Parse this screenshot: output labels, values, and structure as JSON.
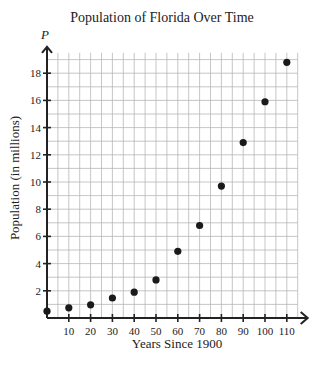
{
  "chart_data": {
    "type": "scatter",
    "title": "Population of Florida Over Time",
    "xlabel": "Years Since 1900",
    "ylabel": "Population (in millions)",
    "y_axis_variable": "P",
    "xlim": [
      0,
      115
    ],
    "ylim": [
      0,
      20
    ],
    "x_ticks": [
      10,
      20,
      30,
      40,
      50,
      60,
      70,
      80,
      90,
      100,
      110
    ],
    "y_ticks": [
      2,
      4,
      6,
      8,
      10,
      12,
      14,
      16,
      18
    ],
    "grid": true,
    "grid_x_step": 5,
    "grid_y_step": 1,
    "legend": null,
    "points": [
      {
        "x": 0,
        "y": 0.5
      },
      {
        "x": 10,
        "y": 0.75
      },
      {
        "x": 20,
        "y": 0.97
      },
      {
        "x": 30,
        "y": 1.47
      },
      {
        "x": 40,
        "y": 1.9
      },
      {
        "x": 50,
        "y": 2.8
      },
      {
        "x": 60,
        "y": 4.9
      },
      {
        "x": 70,
        "y": 6.8
      },
      {
        "x": 80,
        "y": 9.7
      },
      {
        "x": 90,
        "y": 12.9
      },
      {
        "x": 100,
        "y": 15.9
      },
      {
        "x": 110,
        "y": 18.8
      }
    ]
  },
  "colors": {
    "grid": "#b8b8b8",
    "axis": "#222222",
    "point": "#1a1a1a"
  }
}
